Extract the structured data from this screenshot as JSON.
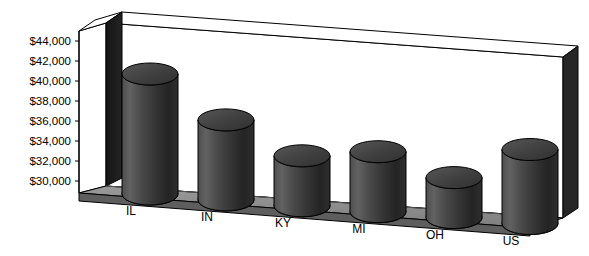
{
  "chart_data": {
    "type": "bar",
    "title": "",
    "subtitle": "",
    "xlabel": "",
    "ylabel": "",
    "categories": [
      "IL",
      "IN",
      "KY",
      "MI",
      "OH",
      "US"
    ],
    "values": [
      42000,
      38000,
      35000,
      36000,
      34000,
      37400
    ],
    "ylim": [
      30000,
      44000
    ],
    "ytick_labels": [
      "$44,000",
      "$42,000",
      "$40,000",
      "$38,000",
      "$36,000",
      "$34,000",
      "$32,000",
      "$30,000"
    ],
    "ytick_values": [
      44000,
      42000,
      40000,
      38000,
      36000,
      34000,
      32000,
      30000
    ],
    "grid": false,
    "legend": null,
    "legend_position": "none",
    "style": "3d-cylinder",
    "series": [
      {
        "name": "Value",
        "values": [
          42000,
          38000,
          35000,
          36000,
          34000,
          37400
        ]
      }
    ],
    "annotations": []
  },
  "colors": {
    "bar_fill_light": "#5a5a5a",
    "bar_fill_mid": "#3c3c3c",
    "bar_fill_dark": "#1e1e1e",
    "bar_top": "#4a4a4a",
    "bar_outline": "#000000",
    "floor": "#8c8c8c",
    "floor_front": "#5e5e5e",
    "back_wall": "#ffffff",
    "left_panel": "#1a1a1a",
    "right_wall_edge": "#262626",
    "text": "#000000"
  }
}
